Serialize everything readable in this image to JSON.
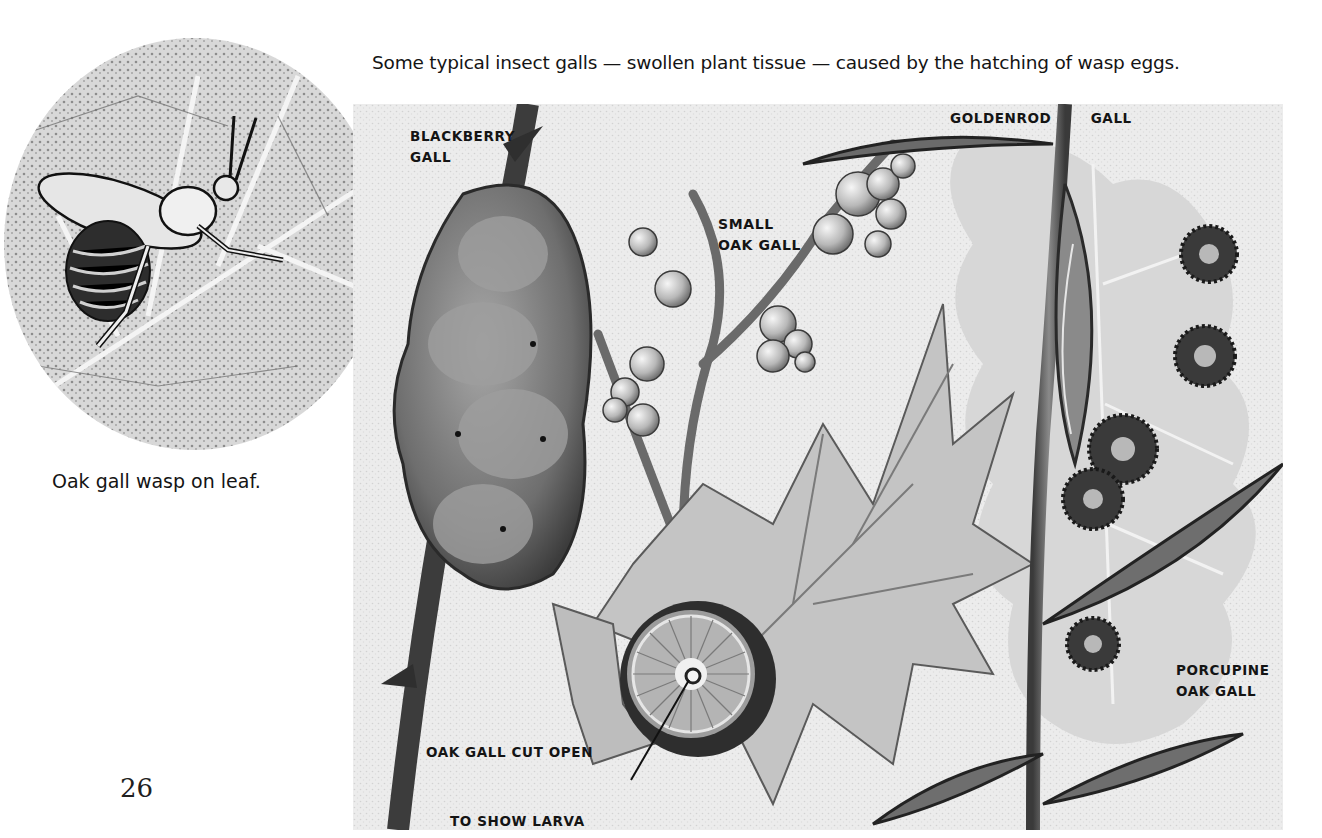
{
  "page": {
    "number": "26",
    "top_caption": "Some typical insect galls — swollen plant tissue — caused by the hatching of wasp eggs.",
    "left_figure": {
      "subject": "wasp-on-leaf-illustration",
      "caption": "Oak gall wasp on leaf."
    },
    "main_plate": {
      "labels": {
        "blackberry_gall": [
          "BLACKBERRY",
          "GALL"
        ],
        "small_oak_gall": [
          "SMALL",
          "OAK GALL"
        ],
        "goldenrod_gall": [
          "GOLDENROD",
          "GALL"
        ],
        "porcupine_oak_gall": [
          "PORCUPINE",
          "OAK GALL"
        ],
        "oak_gall_cut_open": "OAK GALL CUT OPEN",
        "to_show_larva": "TO SHOW LARVA"
      }
    }
  },
  "colors": {
    "paper": "#ffffff",
    "ink": "#141414",
    "plate_background": "#e8e8e8",
    "dark_tone": "#3a3a3a",
    "mid_tone": "#8a8a8a",
    "light_tone": "#cfcfcf"
  }
}
